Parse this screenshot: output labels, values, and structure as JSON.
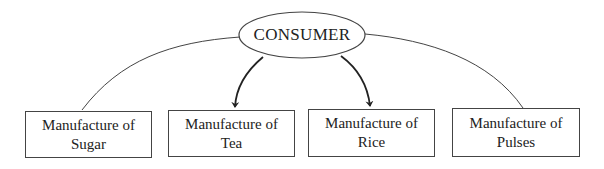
{
  "center": {
    "label": "CONSUMER"
  },
  "nodes": [
    {
      "line1": "Manufacture of",
      "line2": "Sugar",
      "arrow": false
    },
    {
      "line1": "Manufacture of",
      "line2": "Tea",
      "arrow": true
    },
    {
      "line1": "Manufacture of",
      "line2": "Rice",
      "arrow": true
    },
    {
      "line1": "Manufacture of",
      "line2": "Pulses",
      "arrow": false
    }
  ]
}
